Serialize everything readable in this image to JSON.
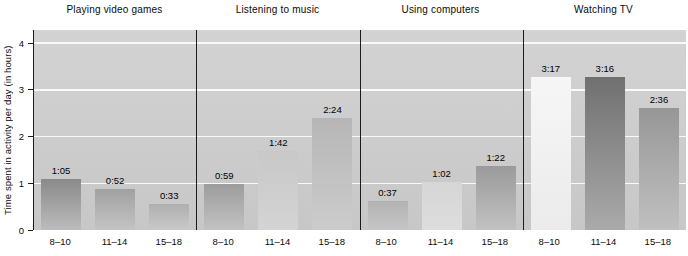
{
  "chart_data": {
    "type": "bar",
    "title": "",
    "ylabel": "Time spent in activity per day (in hours)",
    "ylim": [
      0,
      4.28
    ],
    "yticks": [
      0,
      1,
      2,
      3,
      4
    ],
    "grid": "white horizontal lines at each whole hour, behind bars",
    "legend": "none",
    "categories": [
      "8–10",
      "11–14",
      "15–18"
    ],
    "panels": [
      {
        "title": "Playing video games",
        "labels": [
          "1:05",
          "0:52",
          "0:33"
        ],
        "values_hours": [
          1.083,
          0.867,
          0.55
        ],
        "bar_colors": [
          [
            "#8a8a8a",
            "#bcbcbc"
          ],
          [
            "#a0a0a0",
            "#c4c4c4"
          ],
          [
            "#afafaf",
            "#c9c9c9"
          ]
        ]
      },
      {
        "title": "Listening to music",
        "labels": [
          "0:59",
          "1:42",
          "2:24"
        ],
        "values_hours": [
          0.983,
          1.7,
          2.4
        ],
        "bar_colors": [
          [
            "#9c9c9c",
            "#c2c2c2"
          ],
          [
            "#c8c8c8",
            "#d4d4d4"
          ],
          [
            "#b6b6b6",
            "#cccccc"
          ]
        ]
      },
      {
        "title": "Using computers",
        "labels": [
          "0:37",
          "1:02",
          "1:22"
        ],
        "values_hours": [
          0.617,
          1.033,
          1.367
        ],
        "bar_colors": [
          [
            "#b2b2b2",
            "#c6c6c6"
          ],
          [
            "#d6d6d6",
            "#dddddd"
          ],
          [
            "#9a9a9a",
            "#c2c2c2"
          ]
        ]
      },
      {
        "title": "Watching TV",
        "labels": [
          "3:17",
          "3:16",
          "2:36"
        ],
        "values_hours": [
          3.283,
          3.267,
          2.6
        ],
        "bar_colors": [
          [
            "#f6f6f6",
            "#ebebeb"
          ],
          [
            "#707070",
            "#aaaaaa"
          ],
          [
            "#979797",
            "#c0c0c0"
          ]
        ]
      }
    ],
    "colors": {
      "plot_bg_top": "#d3d3d3",
      "plot_bg_bottom": "#c7c7c7",
      "gridline": "#ffffff",
      "axis_line": "#1c1c1c",
      "text": "#000000"
    }
  }
}
